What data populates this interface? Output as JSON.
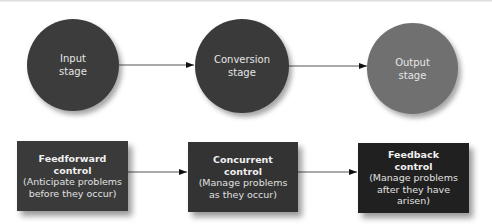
{
  "stages": [
    {
      "id": "input",
      "line1": "Input",
      "line2": "stage",
      "color": "#3c3c3c"
    },
    {
      "id": "conversion",
      "line1": "Conversion",
      "line2": "stage",
      "color": "#3a3a3a"
    },
    {
      "id": "output",
      "line1": "Output",
      "line2": "stage",
      "color": "#707070"
    }
  ],
  "controls": [
    {
      "id": "feedforward",
      "title1": "Feedforward",
      "title2": "control",
      "desc1": "(Anticipate problems",
      "desc2": "before they occur)",
      "color": "#3a3a3a"
    },
    {
      "id": "concurrent",
      "title1": "Concurrent",
      "title2": "control",
      "desc1": "(Manage problems",
      "desc2": "as they occur)",
      "color": "#333333"
    },
    {
      "id": "feedback",
      "title1": "Feedback",
      "title2": "control",
      "desc1": "(Manage problems",
      "desc2": "after they have arisen)",
      "color": "#202020"
    }
  ],
  "connectors": {
    "line_color": "#444444"
  }
}
